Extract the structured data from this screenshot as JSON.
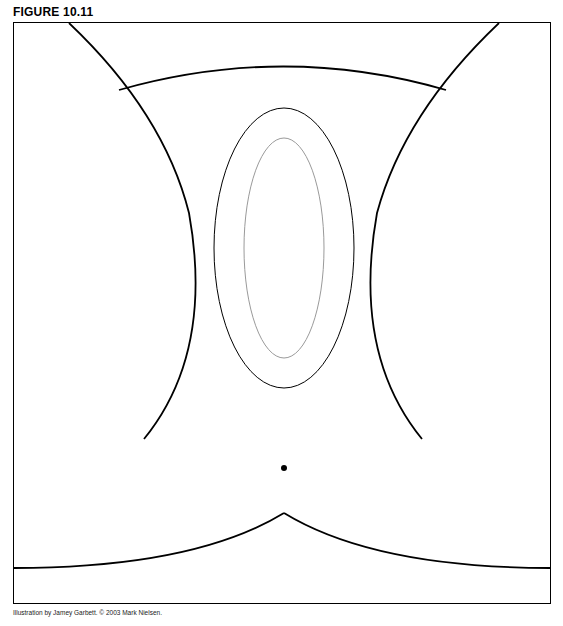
{
  "figure": {
    "label": "FIGURE 10.11",
    "credit": "Illustration by Jamey Garbett. © 2003 Mark Nielsen.",
    "content_description": "Anatomical line drawing (medical textbook illustration)",
    "line_color": "#000000",
    "detail_color": "#9a9a9a"
  }
}
